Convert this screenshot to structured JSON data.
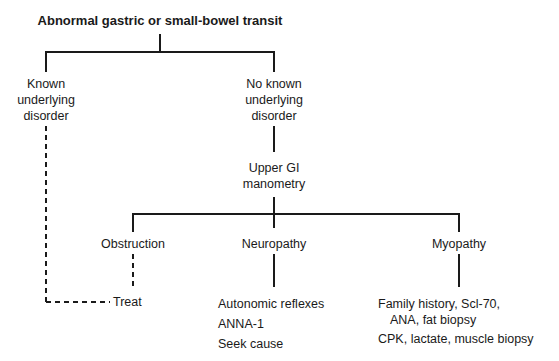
{
  "diagram": {
    "type": "flowchart",
    "root": "Abnormal gastric or small-bowel transit",
    "nodes": {
      "known": [
        "Known",
        "underlying",
        "disorder"
      ],
      "unknown": [
        "No known",
        "underlying",
        "disorder"
      ],
      "manometry": [
        "Upper GI",
        "manometry"
      ],
      "obstruction": "Obstruction",
      "neuropathy": "Neuropathy",
      "myopathy": "Myopathy",
      "treat": "Treat",
      "neuro_tests": [
        "Autonomic reflexes",
        "ANNA-1",
        "Seek cause"
      ],
      "myo_tests": [
        "Family history, Scl-70,",
        "ANA, fat biopsy",
        "CPK, lactate, muscle biopsy"
      ]
    },
    "edges": [
      {
        "from": "root",
        "to": "known",
        "style": "solid"
      },
      {
        "from": "root",
        "to": "unknown",
        "style": "solid"
      },
      {
        "from": "unknown",
        "to": "manometry",
        "style": "solid"
      },
      {
        "from": "manometry",
        "to": "obstruction",
        "style": "solid"
      },
      {
        "from": "manometry",
        "to": "neuropathy",
        "style": "solid"
      },
      {
        "from": "manometry",
        "to": "myopathy",
        "style": "solid"
      },
      {
        "from": "known",
        "to": "treat",
        "style": "dashed"
      },
      {
        "from": "obstruction",
        "to": "treat",
        "style": "dashed"
      },
      {
        "from": "neuropathy",
        "to": "neuro_tests",
        "style": "solid"
      },
      {
        "from": "myopathy",
        "to": "myo_tests",
        "style": "solid"
      }
    ]
  }
}
